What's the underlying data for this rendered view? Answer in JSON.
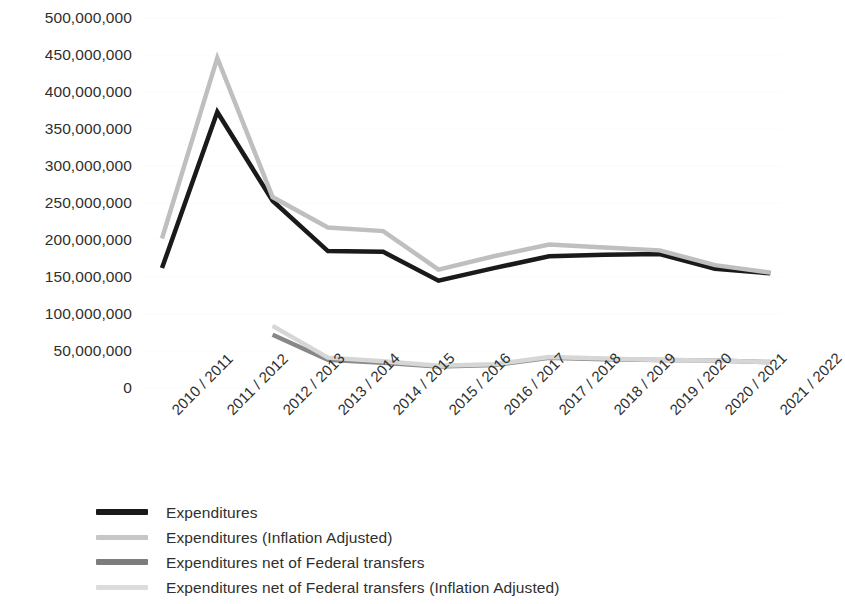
{
  "chart_data": {
    "type": "line",
    "title": "",
    "subtitle": "",
    "xlabel": "",
    "ylabel": "",
    "grid": true,
    "legend_position": "bottom-left",
    "categories": [
      "2010 / 2011",
      "2011 / 2012",
      "2012 / 2013",
      "2013 / 2014",
      "2014 / 2015",
      "2015 / 2016",
      "2016 / 2017",
      "2017 / 2018",
      "2018 / 2019",
      "2019 / 2020",
      "2020 / 2021",
      "2021 / 2022"
    ],
    "ylim": [
      0,
      500000000
    ],
    "ytick_values": [
      500000000,
      450000000,
      400000000,
      350000000,
      300000000,
      250000000,
      200000000,
      150000000,
      100000000,
      50000000,
      0
    ],
    "ytick_labels": [
      "500,000,000",
      "450,000,000",
      "400,000,000",
      "350,000,000",
      "300,000,000",
      "250,000,000",
      "200,000,000",
      "150,000,000",
      "100,000,000",
      "50,000,000",
      "0"
    ],
    "series": [
      {
        "name": "Expenditures",
        "color": "#1a1a1a",
        "width": 4.5,
        "values": [
          162000000,
          373000000,
          253000000,
          185000000,
          184000000,
          145000000,
          162000000,
          178000000,
          180000000,
          181000000,
          161000000,
          155000000
        ]
      },
      {
        "name": "Expenditures (Inflation Adjusted)",
        "color": "#bfbfbf",
        "width": 4.5,
        "values": [
          202000000,
          446000000,
          258000000,
          217000000,
          212000000,
          160000000,
          178000000,
          194000000,
          190000000,
          186000000,
          166000000,
          156000000
        ]
      },
      {
        "name": "Expenditures net of Federal transfers",
        "color": "#888888",
        "width": 4.5,
        "values": [
          null,
          null,
          72000000,
          38000000,
          34000000,
          29000000,
          31000000,
          41000000,
          39000000,
          38000000,
          37000000,
          35000000
        ]
      },
      {
        "name": "Expenditures net of Federal transfers (Inflation Adjusted)",
        "color": "#d6d6d6",
        "width": 4.5,
        "values": [
          null,
          null,
          84000000,
          41000000,
          36000000,
          30000000,
          32000000,
          42000000,
          40000000,
          38000000,
          37000000,
          35000000
        ]
      }
    ]
  },
  "legend": {
    "items": [
      {
        "label": "Expenditures",
        "color": "#1a1a1a"
      },
      {
        "label": "Expenditures (Inflation Adjusted)",
        "color": "#c6c6c6"
      },
      {
        "label": "Expenditures net of Federal transfers",
        "color": "#7d7d7d"
      },
      {
        "label": "Expenditures net of Federal transfers (Inflation Adjusted)",
        "color": "#dcdcdc"
      }
    ]
  }
}
